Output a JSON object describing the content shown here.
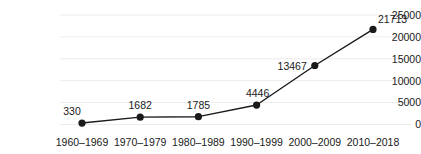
{
  "chart_data": {
    "type": "line",
    "title": "",
    "xlabel": "",
    "ylabel": "",
    "categories": [
      "1960–1969",
      "1970–1979",
      "1980–1989",
      "1990–1999",
      "2000–2009",
      "2010–2018"
    ],
    "values": [
      330,
      1682,
      1785,
      4446,
      13467,
      21713
    ],
    "point_labels": [
      "330",
      "1682",
      "1785",
      "4446",
      "13467",
      "21713"
    ],
    "ylim": [
      0,
      25000
    ],
    "yticks": [
      0,
      5000,
      10000,
      15000,
      20000,
      25000
    ],
    "ytick_labels": [
      "0",
      "5000",
      "10000",
      "15000",
      "20000",
      "25000"
    ],
    "grid": true,
    "grid_axis": "y",
    "legend": false,
    "legend_position": "none",
    "series": [
      {
        "name": "",
        "values": [
          330,
          1682,
          1785,
          4446,
          13467,
          21713
        ]
      }
    ]
  },
  "style": {
    "line_color": "#1a1a1a",
    "marker_color": "#1a1a1a",
    "grid_color": "#ececec",
    "text_color": "#1a1a1a",
    "background": "#ffffff"
  }
}
